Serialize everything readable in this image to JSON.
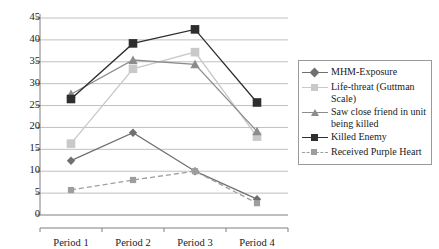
{
  "chart_data": {
    "type": "line",
    "title": "",
    "subtitle": "",
    "xlabel": "",
    "ylabel": "",
    "categories": [
      "Period 1",
      "Period 2",
      "Period 3",
      "Period 4"
    ],
    "ylim": [
      0,
      45
    ],
    "ytick_step": 5,
    "yticks": [
      "0",
      "5",
      "10",
      "15",
      "20",
      "25",
      "30",
      "35",
      "40",
      "45"
    ],
    "grid": "horizontal",
    "legend_position": "right",
    "series": [
      {
        "name": "MHM-Exposure",
        "values": [
          12.4,
          18.8,
          10.0,
          3.6
        ],
        "color": "#707070",
        "marker": "diamond",
        "dash": "solid"
      },
      {
        "name": "Life-threat (Guttman Scale)",
        "values": [
          16.3,
          33.4,
          37.2,
          17.9
        ],
        "color": "#c9c9c9",
        "marker": "square",
        "dash": "solid"
      },
      {
        "name": "Saw close friend in unit being killed",
        "values": [
          27.6,
          35.4,
          34.4,
          19.1
        ],
        "color": "#8c8c8c",
        "marker": "triangle",
        "dash": "solid"
      },
      {
        "name": "Killed Enemy",
        "values": [
          26.5,
          39.2,
          42.4,
          25.7
        ],
        "color": "#2e2e2e",
        "marker": "square",
        "dash": "solid"
      },
      {
        "name": "Received Purple Heart",
        "values": [
          5.7,
          8.0,
          10.0,
          2.7
        ],
        "color": "#9e9e9e",
        "marker": "square-small",
        "dash": "dashed"
      }
    ]
  },
  "legend": {
    "entries": [
      {
        "label": "MHM-Exposure"
      },
      {
        "label": "Life-threat (Guttman Scale)"
      },
      {
        "label": "Saw close friend in unit being killed"
      },
      {
        "label": "Killed Enemy"
      },
      {
        "label": "Received Purple Heart"
      }
    ]
  },
  "axis": {
    "y_labels": [
      "45",
      "40",
      "35",
      "30",
      "25",
      "20",
      "15",
      "10",
      "5",
      "0"
    ],
    "x_labels": [
      "Period 1",
      "Period 2",
      "Period 3",
      "Period 4"
    ]
  },
  "colors": {
    "axis": "#7f7f7f",
    "grid": "#c0c0c0",
    "text": "#1a1a1a",
    "legend_border": "#9a9a9a"
  }
}
